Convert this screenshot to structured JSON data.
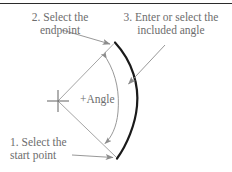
{
  "figure": {
    "top_rule": true,
    "callouts": {
      "endpoint": {
        "line1": "2. Select the",
        "line2": "endpoint"
      },
      "angle_entry": {
        "line1": "3. Enter or select the",
        "line2": "included angle"
      },
      "start_point": {
        "line1": "1. Select the",
        "line2": "start point"
      },
      "angle_value": "+Angle"
    },
    "colors": {
      "text": "#6d6d6d",
      "rule": "#2b2b2b",
      "arc_main": "#1a1a1a",
      "leader": "#8c8c8c",
      "radius": "#9a9a9a",
      "angle_arc": "#8c8c8c",
      "crosshair": "#6f6f6f",
      "background": "#ffffff"
    },
    "geometry": {
      "center_x": 58,
      "center_y": 101,
      "arc_top_x": 115,
      "arc_top_y": 43,
      "arc_bottom_x": 117,
      "arc_bottom_y": 158,
      "arc_bulge_x": 137,
      "crosshair_size": 11,
      "arc_stroke_width": 2.2
    }
  }
}
